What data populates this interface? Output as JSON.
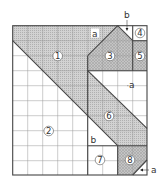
{
  "diagram": {
    "type": "grid-dissection-puzzle",
    "grid": {
      "columns": 9,
      "rows": 10
    },
    "colors": {
      "shade": "#c9c9c9",
      "dark_shade": "#b5b5b5",
      "line": "#444444",
      "grid": "#9a9a9a",
      "white": "#ffffff"
    },
    "regions": [
      {
        "id": "1",
        "label": "1",
        "shading": "shaded"
      },
      {
        "id": "2",
        "label": "2",
        "shading": "white"
      },
      {
        "id": "3",
        "label": "3",
        "shading": "dark-shaded"
      },
      {
        "id": "4",
        "label": "4",
        "shading": "white"
      },
      {
        "id": "5",
        "label": "5",
        "shading": "dark-shaded"
      },
      {
        "id": "6",
        "label": "6",
        "shading": "shaded"
      },
      {
        "id": "7",
        "label": "7",
        "shading": "white"
      },
      {
        "id": "8",
        "label": "8",
        "shading": "shaded"
      }
    ],
    "annotations": {
      "a_top": "a",
      "b_top": "b",
      "a_right": "a",
      "b_middle": "b",
      "a_bottom": "a"
    }
  }
}
